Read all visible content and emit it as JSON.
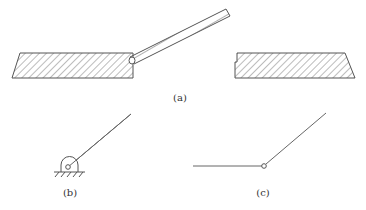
{
  "figure": {
    "panels": [
      {
        "id": "a",
        "label": "(a)",
        "description": "Rod inserted at angle into left hatched block; separate hatched block on right"
      },
      {
        "id": "b",
        "label": "(b)",
        "description": "Line pivoted on fixed ground support (hinge symbol)"
      },
      {
        "id": "c",
        "label": "(c)",
        "description": "Two line segments joined at a pin joint"
      }
    ]
  },
  "colors": {
    "stroke": "#555555",
    "hatch": "#777777",
    "background": "#ffffff"
  }
}
